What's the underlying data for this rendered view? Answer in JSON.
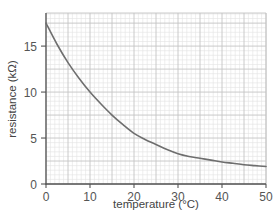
{
  "chart_data": {
    "type": "line",
    "title": "",
    "xlabel": "temperature (°C)",
    "ylabel": "resistance (kΩ)",
    "xlim": [
      0,
      50
    ],
    "ylim": [
      0,
      18.6
    ],
    "x_ticks": [
      0,
      10,
      20,
      30,
      40,
      50
    ],
    "y_ticks": [
      0,
      5,
      10,
      15
    ],
    "x_tick_labels": [
      "0",
      "10",
      "20",
      "30",
      "40",
      "50"
    ],
    "y_tick_labels": [
      "0",
      "5",
      "10",
      "15"
    ],
    "grid": {
      "on": true,
      "x_minor_step": 1,
      "x_major_step": 5,
      "y_minor_step": 0.5,
      "y_major_step": 2.5
    },
    "legend": null,
    "series": [
      {
        "name": "thermistor resistance",
        "x": [
          0,
          2.5,
          5,
          7.5,
          10,
          12.5,
          15,
          17.5,
          20,
          22.5,
          25,
          27.5,
          30,
          32.5,
          35,
          37.5,
          40,
          42.5,
          45,
          47.5,
          50
        ],
        "values": [
          17.5,
          15.2,
          13.2,
          11.5,
          10.0,
          8.7,
          7.5,
          6.45,
          5.5,
          4.85,
          4.3,
          3.75,
          3.3,
          3.0,
          2.8,
          2.6,
          2.4,
          2.25,
          2.1,
          2.0,
          1.9
        ]
      }
    ]
  },
  "colors": {
    "curve": "#6e6e6e",
    "axis": "#555555",
    "grid_minor": "#e2e2e2",
    "grid_major": "#c4c4c4",
    "text": "#555555"
  }
}
